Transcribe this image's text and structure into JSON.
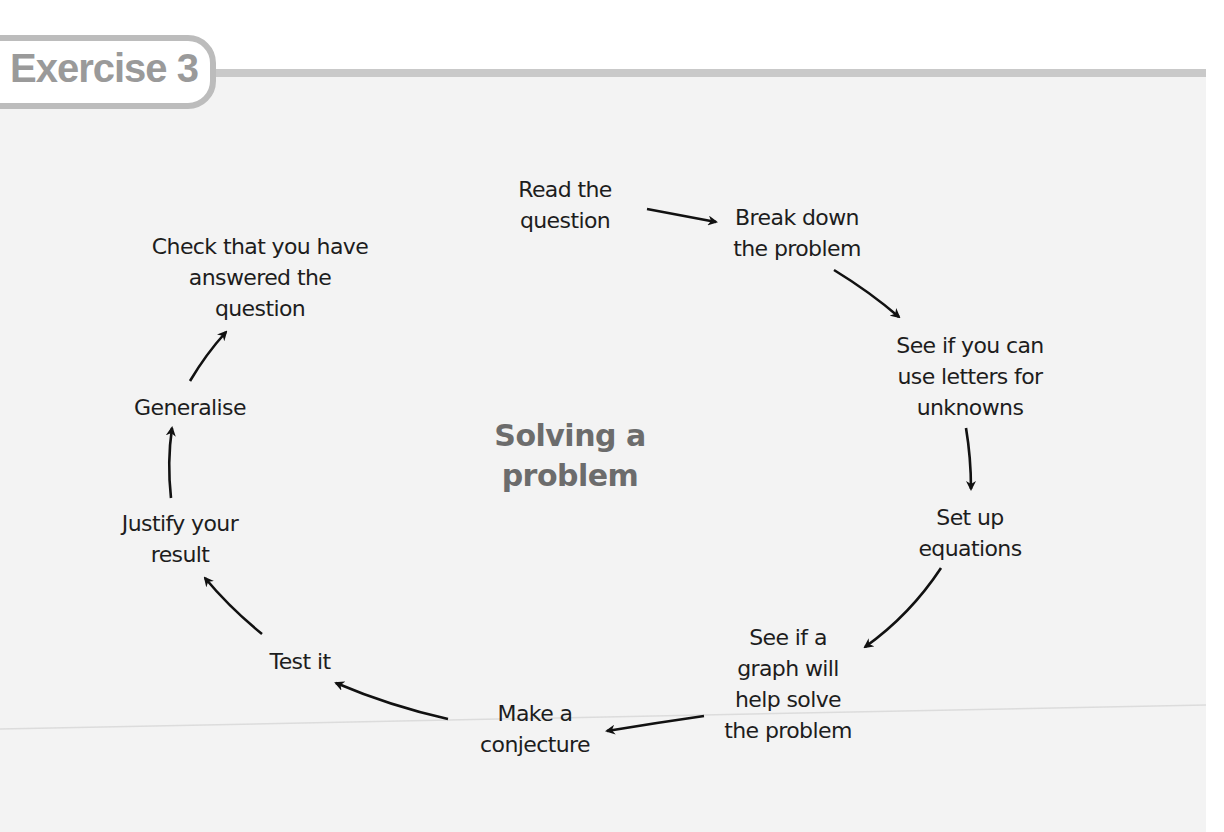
{
  "exercise": {
    "label": "Exercise 3"
  },
  "diagram": {
    "title": "Solving a\nproblem",
    "steps": [
      {
        "id": "read",
        "label": "Read the\nquestion"
      },
      {
        "id": "break",
        "label": "Break down\nthe problem"
      },
      {
        "id": "letters",
        "label": "See if you can\nuse letters for\nunknowns"
      },
      {
        "id": "equations",
        "label": "Set up\nequations"
      },
      {
        "id": "graph",
        "label": "See if a\ngraph will\nhelp solve\nthe problem"
      },
      {
        "id": "conjecture",
        "label": "Make a\nconjecture"
      },
      {
        "id": "test",
        "label": "Test it"
      },
      {
        "id": "justify",
        "label": "Justify your\nresult"
      },
      {
        "id": "generalise",
        "label": "Generalise"
      },
      {
        "id": "check",
        "label": "Check that you have\nanswered the\nquestion"
      }
    ],
    "flow": [
      [
        "read",
        "break"
      ],
      [
        "break",
        "letters"
      ],
      [
        "letters",
        "equations"
      ],
      [
        "equations",
        "graph"
      ],
      [
        "graph",
        "conjecture"
      ],
      [
        "conjecture",
        "test"
      ],
      [
        "test",
        "justify"
      ],
      [
        "justify",
        "generalise"
      ],
      [
        "generalise",
        "check"
      ]
    ]
  },
  "colors": {
    "tab_border": "#bcbcbc",
    "tab_text": "#9a9a9a",
    "header_bar": "#c9c9c9",
    "panel_bg": "#f3f3f3",
    "title_text": "#6c6c6c",
    "node_text": "#1d1d1d",
    "arrow": "#111111"
  }
}
